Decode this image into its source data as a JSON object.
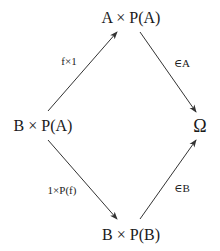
{
  "diagram": {
    "type": "commutative-diagram",
    "nodes": {
      "top": {
        "label": "A × P(A)"
      },
      "left": {
        "label": "B × P(A)"
      },
      "right": {
        "label": "Ω"
      },
      "bottom": {
        "label": "B × P(B)"
      }
    },
    "arrows": [
      {
        "from": "left",
        "to": "top",
        "label": "f×1"
      },
      {
        "from": "top",
        "to": "right",
        "label": "∈A"
      },
      {
        "from": "left",
        "to": "bottom",
        "label": "1×P(f)"
      },
      {
        "from": "bottom",
        "to": "right",
        "label": "∈B"
      }
    ],
    "colors": {
      "stroke": "#333333",
      "text": "#1a1a1a",
      "background": "#ffffff"
    }
  }
}
